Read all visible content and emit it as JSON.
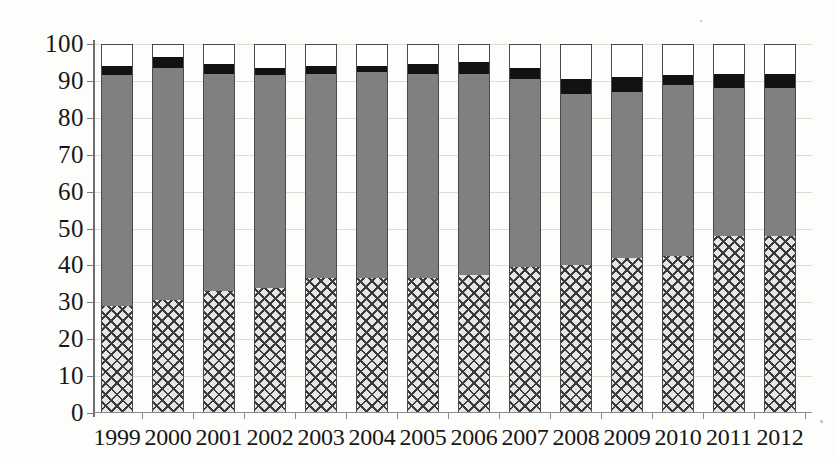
{
  "chart_data": {
    "type": "bar",
    "stacked": true,
    "title": "",
    "subtitle": "",
    "xlabel": "",
    "ylabel": "",
    "ylim": [
      0,
      100
    ],
    "ytick_values": [
      0,
      10,
      20,
      30,
      40,
      50,
      60,
      70,
      80,
      90,
      100
    ],
    "ytick_labels": [
      "0",
      "10",
      "20",
      "30",
      "40",
      "50",
      "60",
      "70",
      "80",
      "90",
      "100"
    ],
    "grid": true,
    "grid_axis": "y",
    "legend": false,
    "legend_position": "none",
    "categories": [
      "1999",
      "2000",
      "2001",
      "2002",
      "2003",
      "2004",
      "2005",
      "2006",
      "2007",
      "2008",
      "2009",
      "2010",
      "2011",
      "2012"
    ],
    "series": [
      {
        "name": "crosshatch",
        "pattern": "crosshatch",
        "color": "#e6e6e4",
        "values": [
          29.0,
          30.5,
          33.0,
          34.0,
          36.5,
          36.5,
          36.5,
          37.5,
          39.5,
          40.0,
          42.0,
          42.5,
          48.0,
          48.0
        ]
      },
      {
        "name": "gray",
        "pattern": "solid",
        "color": "#808080",
        "values": [
          62.5,
          63.0,
          59.0,
          57.5,
          55.5,
          56.0,
          55.5,
          54.5,
          51.0,
          46.5,
          45.0,
          46.5,
          40.0,
          40.0
        ]
      },
      {
        "name": "black",
        "pattern": "solid",
        "color": "#121212",
        "values": [
          2.5,
          3.0,
          2.5,
          2.0,
          2.0,
          1.5,
          2.5,
          3.0,
          3.0,
          4.0,
          4.0,
          2.5,
          4.0,
          4.0
        ]
      },
      {
        "name": "white",
        "pattern": "solid",
        "color": "#ffffff",
        "values": [
          6.0,
          3.5,
          5.5,
          6.5,
          6.0,
          6.0,
          5.5,
          5.0,
          6.5,
          9.5,
          9.0,
          8.5,
          8.0,
          8.0
        ]
      }
    ],
    "cumulative_tops": {
      "crosshatch": [
        29.0,
        30.5,
        33.0,
        34.0,
        36.5,
        36.5,
        36.5,
        37.5,
        39.5,
        40.0,
        42.0,
        42.5,
        48.0,
        48.0
      ],
      "gray": [
        91.5,
        93.5,
        92.0,
        91.5,
        92.0,
        92.5,
        92.0,
        92.0,
        90.5,
        86.5,
        87.0,
        89.0,
        88.0,
        88.0
      ],
      "black": [
        94.0,
        96.5,
        94.5,
        93.5,
        94.0,
        94.0,
        94.5,
        95.0,
        93.5,
        90.5,
        91.0,
        91.5,
        92.0,
        92.0
      ],
      "white": [
        100,
        100,
        100,
        100,
        100,
        100,
        100,
        100,
        100,
        100,
        100,
        100,
        100,
        100
      ]
    }
  },
  "colors": {
    "gray": "#808080",
    "black": "#121212",
    "white": "#ffffff",
    "hatch_fill": "#e6e6e4",
    "hatch_line": "#3b3b3b",
    "axis": "#6e6e6e",
    "grid": "#dcdcd8",
    "text": "#171717"
  }
}
